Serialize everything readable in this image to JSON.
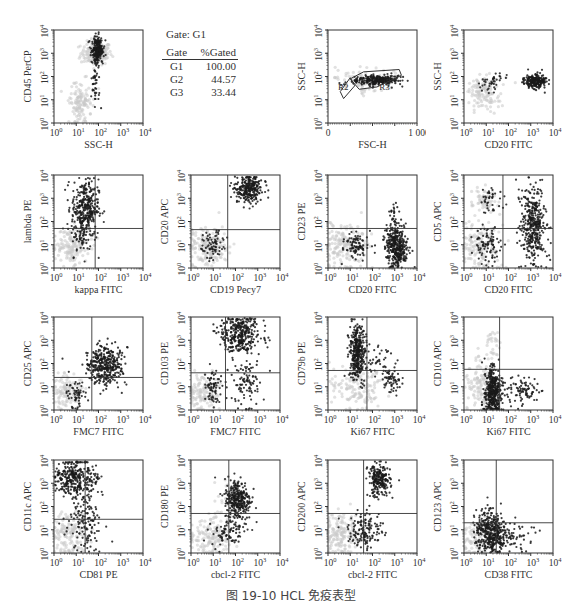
{
  "figure": {
    "caption": "图 19-10    HCL 免疫表型"
  },
  "gate_stats": {
    "title": "Gate:  G1",
    "headers": [
      "Gate",
      "%Gated"
    ],
    "rows": [
      {
        "gate": "G1",
        "pct": "100.00"
      },
      {
        "gate": "G2",
        "pct": "44.57"
      },
      {
        "gate": "G3",
        "pct": "33.44"
      }
    ]
  },
  "colors": {
    "dark_events": "#1a1a1a",
    "light_events": "#c8c8c8",
    "axis": "#333333"
  },
  "chart_data": [
    {
      "id": "p1",
      "type": "scatter",
      "title": "",
      "xlabel": "SSC-H",
      "ylabel": "CD45 PerCP",
      "scale": "log",
      "xticks": [
        "10⁰",
        "10¹",
        "10²",
        "10³",
        "10⁴"
      ],
      "yticks": [
        "10⁰",
        "10¹",
        "10²",
        "10³",
        "10⁴"
      ],
      "quadrant": null,
      "clusters": [
        {
          "color": "light",
          "cx": 1.9,
          "cy": 3.0,
          "sx": 0.35,
          "sy": 0.25,
          "n": 160
        },
        {
          "color": "light",
          "cx": 1.2,
          "cy": 0.9,
          "sx": 0.25,
          "sy": 0.4,
          "n": 120
        },
        {
          "color": "dark",
          "cx": 1.95,
          "cy": 3.1,
          "sx": 0.12,
          "sy": 0.3,
          "n": 220
        },
        {
          "color": "dark",
          "cx": 1.85,
          "cy": 1.5,
          "sx": 0.1,
          "sy": 0.6,
          "n": 40
        }
      ]
    },
    {
      "id": "p2",
      "type": "scatter",
      "title": "",
      "xlabel": "FSC-H",
      "ylabel": "SSC-H",
      "scale": "lin-log",
      "xticks": [
        "0",
        "",
        "",
        "",
        "1 000"
      ],
      "yticks": [
        "10⁰",
        "10¹",
        "10²",
        "10³",
        "10⁴"
      ],
      "quadrant": null,
      "gates": [
        "R2",
        "R3"
      ],
      "clusters": [
        {
          "color": "light",
          "cx": 1.5,
          "cy": 1.8,
          "sx": 0.6,
          "sy": 0.3,
          "n": 90
        },
        {
          "color": "dark",
          "cx": 2.2,
          "cy": 1.85,
          "sx": 0.5,
          "sy": 0.12,
          "n": 260
        }
      ]
    },
    {
      "id": "p3",
      "type": "scatter",
      "title": "",
      "xlabel": "CD20 FITC",
      "ylabel": "SSC-H",
      "scale": "log",
      "xticks": [
        "10⁰",
        "10¹",
        "10²",
        "10³",
        "10⁴"
      ],
      "yticks": [
        "10⁰",
        "10¹",
        "10²",
        "10³",
        "10⁴"
      ],
      "quadrant": null,
      "clusters": [
        {
          "color": "light",
          "cx": 0.9,
          "cy": 1.3,
          "sx": 0.4,
          "sy": 0.35,
          "n": 120
        },
        {
          "color": "dark",
          "cx": 3.2,
          "cy": 1.8,
          "sx": 0.25,
          "sy": 0.15,
          "n": 220
        },
        {
          "color": "dark",
          "cx": 1.3,
          "cy": 1.8,
          "sx": 0.3,
          "sy": 0.2,
          "n": 40
        }
      ]
    },
    {
      "id": "p4",
      "type": "scatter",
      "title": "",
      "xlabel": "kappa FITC",
      "ylabel": "lambda PE",
      "scale": "log",
      "xticks": [
        "10⁰",
        "10¹",
        "10²",
        "10³",
        "10⁴"
      ],
      "yticks": [
        "10⁰",
        "10¹",
        "10²",
        "10³",
        "10⁴"
      ],
      "quadrant": [
        1.85,
        1.7
      ],
      "clusters": [
        {
          "color": "light",
          "cx": 0.8,
          "cy": 0.9,
          "sx": 0.4,
          "sy": 0.4,
          "n": 140
        },
        {
          "color": "dark",
          "cx": 1.4,
          "cy": 2.6,
          "sx": 0.3,
          "sy": 0.6,
          "n": 320
        },
        {
          "color": "dark",
          "cx": 1.3,
          "cy": 1.3,
          "sx": 0.25,
          "sy": 0.4,
          "n": 60
        }
      ]
    },
    {
      "id": "p5",
      "type": "scatter",
      "title": "",
      "xlabel": "CD19 Pecy7",
      "ylabel": "CD20 APC",
      "scale": "log",
      "xticks": [
        "10⁰",
        "10¹",
        "10²",
        "10³",
        "10⁴"
      ],
      "yticks": [
        "10⁰",
        "10¹",
        "10²",
        "10³",
        "10⁴"
      ],
      "quadrant": [
        1.65,
        1.65
      ],
      "clusters": [
        {
          "color": "light",
          "cx": 0.8,
          "cy": 0.9,
          "sx": 0.45,
          "sy": 0.5,
          "n": 170
        },
        {
          "color": "dark",
          "cx": 2.6,
          "cy": 3.4,
          "sx": 0.3,
          "sy": 0.3,
          "n": 260
        },
        {
          "color": "dark",
          "cx": 1.0,
          "cy": 1.0,
          "sx": 0.25,
          "sy": 0.35,
          "n": 70
        }
      ]
    },
    {
      "id": "p6",
      "type": "scatter",
      "title": "",
      "xlabel": "CD20 FITC",
      "ylabel": "CD23 PE",
      "scale": "log",
      "xticks": [
        "10⁰",
        "10¹",
        "10²",
        "10³",
        "10⁴"
      ],
      "yticks": [
        "10⁰",
        "10¹",
        "10²",
        "10³",
        "10⁴"
      ],
      "quadrant": [
        1.75,
        1.7
      ],
      "clusters": [
        {
          "color": "light",
          "cx": 0.8,
          "cy": 0.9,
          "sx": 0.5,
          "sy": 0.45,
          "n": 170
        },
        {
          "color": "dark",
          "cx": 3.1,
          "cy": 0.9,
          "sx": 0.25,
          "sy": 0.45,
          "n": 360
        },
        {
          "color": "dark",
          "cx": 1.3,
          "cy": 1.0,
          "sx": 0.3,
          "sy": 0.3,
          "n": 90
        },
        {
          "color": "dark",
          "cx": 3.0,
          "cy": 2.3,
          "sx": 0.15,
          "sy": 0.4,
          "n": 25
        }
      ]
    },
    {
      "id": "p7",
      "type": "scatter",
      "title": "",
      "xlabel": "CD20 FITC",
      "ylabel": "CD5 APC",
      "scale": "log",
      "xticks": [
        "10⁰",
        "10¹",
        "10²",
        "10³",
        "10⁴"
      ],
      "yticks": [
        "10⁰",
        "10¹",
        "10²",
        "10³",
        "10⁴"
      ],
      "quadrant": [
        1.75,
        1.7
      ],
      "clusters": [
        {
          "color": "light",
          "cx": 0.8,
          "cy": 0.9,
          "sx": 0.4,
          "sy": 0.45,
          "n": 140
        },
        {
          "color": "light",
          "cx": 0.9,
          "cy": 2.9,
          "sx": 0.3,
          "sy": 0.3,
          "n": 60
        },
        {
          "color": "dark",
          "cx": 3.1,
          "cy": 1.8,
          "sx": 0.28,
          "sy": 0.8,
          "n": 380
        },
        {
          "color": "dark",
          "cx": 1.1,
          "cy": 1.0,
          "sx": 0.3,
          "sy": 0.4,
          "n": 90
        },
        {
          "color": "dark",
          "cx": 1.2,
          "cy": 2.9,
          "sx": 0.25,
          "sy": 0.3,
          "n": 40
        }
      ]
    },
    {
      "id": "p8",
      "type": "scatter",
      "title": "",
      "xlabel": "FMC7 FITC",
      "ylabel": "CD25 APC",
      "scale": "log",
      "xticks": [
        "10⁰",
        "10¹",
        "10²",
        "10³",
        "10⁴"
      ],
      "yticks": [
        "10⁰",
        "10¹",
        "10²",
        "10³",
        "10⁴"
      ],
      "quadrant": [
        1.7,
        1.4
      ],
      "clusters": [
        {
          "color": "light",
          "cx": 0.6,
          "cy": 0.8,
          "sx": 0.35,
          "sy": 0.35,
          "n": 110
        },
        {
          "color": "dark",
          "cx": 2.3,
          "cy": 1.9,
          "sx": 0.4,
          "sy": 0.4,
          "n": 360
        },
        {
          "color": "dark",
          "cx": 1.0,
          "cy": 0.7,
          "sx": 0.25,
          "sy": 0.3,
          "n": 60
        }
      ]
    },
    {
      "id": "p9",
      "type": "scatter",
      "title": "",
      "xlabel": "FMC7 FITC",
      "ylabel": "CD103 PE",
      "scale": "log",
      "xticks": [
        "10⁰",
        "10¹",
        "10²",
        "10³",
        "10⁴"
      ],
      "yticks": [
        "10⁰",
        "10¹",
        "10²",
        "10³",
        "10⁴"
      ],
      "quadrant": [
        1.55,
        1.6
      ],
      "clusters": [
        {
          "color": "light",
          "cx": 0.6,
          "cy": 0.7,
          "sx": 0.35,
          "sy": 0.4,
          "n": 120
        },
        {
          "color": "dark",
          "cx": 2.2,
          "cy": 3.3,
          "sx": 0.45,
          "sy": 0.45,
          "n": 340
        },
        {
          "color": "dark",
          "cx": 2.4,
          "cy": 1.2,
          "sx": 0.3,
          "sy": 0.6,
          "n": 100
        },
        {
          "color": "dark",
          "cx": 1.0,
          "cy": 1.1,
          "sx": 0.2,
          "sy": 0.35,
          "n": 70
        }
      ]
    },
    {
      "id": "p10",
      "type": "scatter",
      "title": "",
      "xlabel": "Ki67 FITC",
      "ylabel": "CD79b PE",
      "scale": "log",
      "xticks": [
        "10⁰",
        "10¹",
        "10²",
        "10³",
        "10⁴"
      ],
      "yticks": [
        "10⁰",
        "10¹",
        "10²",
        "10³",
        "10⁴"
      ],
      "quadrant": [
        1.75,
        1.7
      ],
      "clusters": [
        {
          "color": "light",
          "cx": 1.3,
          "cy": 1.0,
          "sx": 0.6,
          "sy": 0.5,
          "n": 150
        },
        {
          "color": "dark",
          "cx": 1.3,
          "cy": 2.5,
          "sx": 0.18,
          "sy": 0.6,
          "n": 340
        },
        {
          "color": "dark",
          "cx": 2.9,
          "cy": 1.3,
          "sx": 0.2,
          "sy": 0.3,
          "n": 60
        },
        {
          "color": "dark",
          "cx": 2.2,
          "cy": 2.3,
          "sx": 0.3,
          "sy": 0.4,
          "n": 40
        }
      ]
    },
    {
      "id": "p11",
      "type": "scatter",
      "title": "",
      "xlabel": "Ki67 FITC",
      "ylabel": "CD10 APC",
      "scale": "log",
      "xticks": [
        "10⁰",
        "10¹",
        "10²",
        "10³",
        "10⁴"
      ],
      "yticks": [
        "10⁰",
        "10¹",
        "10²",
        "10³",
        "10⁴"
      ],
      "quadrant": [
        1.6,
        1.75
      ],
      "clusters": [
        {
          "color": "light",
          "cx": 0.8,
          "cy": 1.0,
          "sx": 0.4,
          "sy": 0.5,
          "n": 140
        },
        {
          "color": "light",
          "cx": 1.3,
          "cy": 2.8,
          "sx": 0.15,
          "sy": 0.4,
          "n": 30
        },
        {
          "color": "dark",
          "cx": 1.3,
          "cy": 0.8,
          "sx": 0.18,
          "sy": 0.5,
          "n": 380
        },
        {
          "color": "dark",
          "cx": 2.6,
          "cy": 0.8,
          "sx": 0.4,
          "sy": 0.3,
          "n": 90
        }
      ]
    },
    {
      "id": "p12",
      "type": "scatter",
      "title": "",
      "xlabel": "CD81 PE",
      "ylabel": "CD11c APC",
      "scale": "log",
      "xticks": [
        "10⁰",
        "10¹",
        "10²",
        "10³",
        "10⁴"
      ],
      "yticks": [
        "10⁰",
        "10¹",
        "10²",
        "10³",
        "10⁴"
      ],
      "quadrant": [
        1.4,
        1.45
      ],
      "clusters": [
        {
          "color": "light",
          "cx": 0.7,
          "cy": 0.8,
          "sx": 0.4,
          "sy": 0.45,
          "n": 140
        },
        {
          "color": "dark",
          "cx": 1.0,
          "cy": 3.2,
          "sx": 0.5,
          "sy": 0.4,
          "n": 330
        },
        {
          "color": "dark",
          "cx": 1.4,
          "cy": 1.3,
          "sx": 0.4,
          "sy": 0.6,
          "n": 130
        }
      ]
    },
    {
      "id": "p13",
      "type": "scatter",
      "title": "",
      "xlabel": "cbcl-2 FITC",
      "ylabel": "CD180 PE",
      "scale": "log",
      "xticks": [
        "10⁰",
        "10¹",
        "10²",
        "10³",
        "10⁴"
      ],
      "yticks": [
        "10⁰",
        "10¹",
        "10²",
        "10³",
        "10⁴"
      ],
      "quadrant": [
        1.7,
        1.7
      ],
      "clusters": [
        {
          "color": "light",
          "cx": 0.8,
          "cy": 0.7,
          "sx": 0.45,
          "sy": 0.4,
          "n": 150
        },
        {
          "color": "light",
          "cx": 1.8,
          "cy": 2.3,
          "sx": 0.3,
          "sy": 0.4,
          "n": 50
        },
        {
          "color": "dark",
          "cx": 2.1,
          "cy": 2.3,
          "sx": 0.3,
          "sy": 0.45,
          "n": 300
        },
        {
          "color": "dark",
          "cx": 1.7,
          "cy": 1.0,
          "sx": 0.4,
          "sy": 0.35,
          "n": 80
        }
      ]
    },
    {
      "id": "p14",
      "type": "scatter",
      "title": "",
      "xlabel": "cbcl-2 FITC",
      "ylabel": "CD200 APC",
      "scale": "log",
      "xticks": [
        "10⁰",
        "10¹",
        "10²",
        "10³",
        "10⁴"
      ],
      "yticks": [
        "10⁰",
        "10¹",
        "10²",
        "10³",
        "10⁴"
      ],
      "quadrant": [
        1.6,
        1.7
      ],
      "clusters": [
        {
          "color": "light",
          "cx": 0.6,
          "cy": 0.8,
          "sx": 0.4,
          "sy": 0.45,
          "n": 160
        },
        {
          "color": "dark",
          "cx": 2.3,
          "cy": 3.1,
          "sx": 0.25,
          "sy": 0.35,
          "n": 220
        },
        {
          "color": "dark",
          "cx": 1.7,
          "cy": 1.0,
          "sx": 0.4,
          "sy": 0.4,
          "n": 140
        }
      ]
    },
    {
      "id": "p15",
      "type": "scatter",
      "title": "",
      "xlabel": "CD38 FITC",
      "ylabel": "CD123 APC",
      "scale": "log",
      "xticks": [
        "10⁰",
        "10¹",
        "10²",
        "10³",
        "10⁴"
      ],
      "yticks": [
        "10⁰",
        "10¹",
        "10²",
        "10³",
        "10⁴"
      ],
      "quadrant": [
        1.45,
        1.3
      ],
      "clusters": [
        {
          "color": "light",
          "cx": 0.5,
          "cy": 0.6,
          "sx": 0.3,
          "sy": 0.4,
          "n": 80
        },
        {
          "color": "dark",
          "cx": 1.2,
          "cy": 0.9,
          "sx": 0.35,
          "sy": 0.45,
          "n": 400
        },
        {
          "color": "dark",
          "cx": 2.2,
          "cy": 0.7,
          "sx": 0.4,
          "sy": 0.35,
          "n": 50
        }
      ]
    }
  ],
  "layout": {
    "panels": [
      {
        "chart": 0,
        "x": 22,
        "y": 22
      },
      {
        "chart": 1,
        "x": 296,
        "y": 22
      },
      {
        "chart": 2,
        "x": 432,
        "y": 22
      },
      {
        "chart": 3,
        "x": 22,
        "y": 167
      },
      {
        "chart": 4,
        "x": 159,
        "y": 167
      },
      {
        "chart": 5,
        "x": 296,
        "y": 167
      },
      {
        "chart": 6,
        "x": 432,
        "y": 167
      },
      {
        "chart": 7,
        "x": 22,
        "y": 309
      },
      {
        "chart": 8,
        "x": 159,
        "y": 309
      },
      {
        "chart": 9,
        "x": 296,
        "y": 309
      },
      {
        "chart": 10,
        "x": 432,
        "y": 309
      },
      {
        "chart": 11,
        "x": 22,
        "y": 452
      },
      {
        "chart": 12,
        "x": 159,
        "y": 452
      },
      {
        "chart": 13,
        "x": 296,
        "y": 452
      },
      {
        "chart": 14,
        "x": 432,
        "y": 452
      }
    ]
  }
}
